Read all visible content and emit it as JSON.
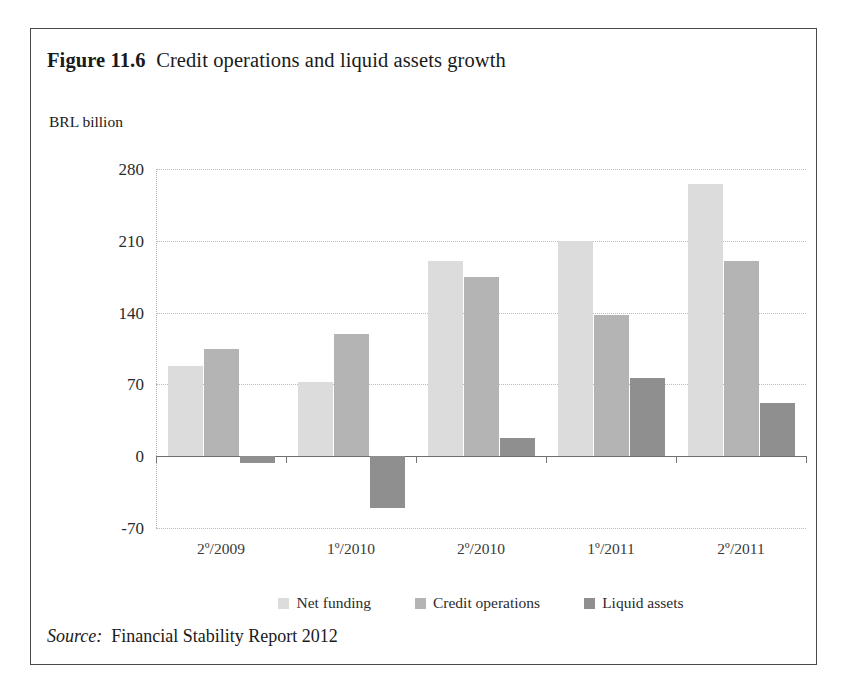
{
  "figure": {
    "label": "Figure 11.6",
    "caption": "Credit operations and liquid assets growth",
    "unit_label": "BRL billion",
    "source_label": "Source:",
    "source_text": "Financial Stability Report 2012"
  },
  "legend": {
    "items": [
      {
        "name": "Net funding",
        "color": "#dcdcdc"
      },
      {
        "name": "Credit operations",
        "color": "#b4b4b4"
      },
      {
        "name": "Liquid assets",
        "color": "#8f8f8f"
      }
    ]
  },
  "chart_data": {
    "type": "bar",
    "subtitle": "",
    "xlabel": "",
    "ylabel": "BRL billion",
    "ylim": [
      -70,
      280
    ],
    "yticks": [
      280,
      210,
      140,
      70,
      0,
      -70
    ],
    "ytick_labels": [
      "280",
      "210",
      "140",
      "70",
      "0",
      "-70"
    ],
    "grid": true,
    "legend_position": "bottom",
    "categories": [
      "2º/2009",
      "1º/2010",
      "2º/2010",
      "1º/2011",
      "2º/2011"
    ],
    "series": [
      {
        "name": "Net funding",
        "color": "#dcdcdc",
        "values": [
          88,
          72,
          190,
          210,
          265
        ]
      },
      {
        "name": "Credit operations",
        "color": "#b4b4b4",
        "values": [
          105,
          119,
          175,
          138,
          190
        ]
      },
      {
        "name": "Liquid assets",
        "color": "#8f8f8f",
        "values": [
          -7,
          -50,
          18,
          76,
          52
        ]
      }
    ]
  }
}
